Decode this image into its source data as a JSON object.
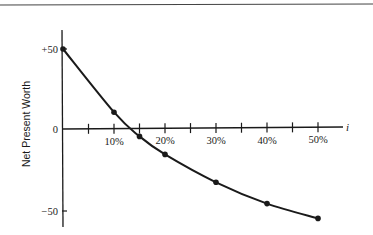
{
  "chart_data": {
    "type": "line",
    "title": "",
    "xlabel": "i",
    "ylabel": "Net Present Worth",
    "x": [
      0,
      10,
      15,
      20,
      30,
      40,
      50
    ],
    "series": [
      {
        "name": "Net Present Worth",
        "values": [
          50,
          10.5,
          -4.5,
          -15.5,
          -32.5,
          -45.5,
          -54.5
        ],
        "markers": true,
        "smooth": true
      }
    ],
    "x_ticks": [
      5,
      10,
      15,
      20,
      25,
      30,
      35,
      40,
      45,
      50
    ],
    "x_tick_labels": [
      {
        "value": 10,
        "label": "10%"
      },
      {
        "value": 20,
        "label": "20%"
      },
      {
        "value": 30,
        "label": "30%"
      },
      {
        "value": 40,
        "label": "40%"
      },
      {
        "value": 50,
        "label": "50%"
      }
    ],
    "y_ticks": [
      {
        "value": 50,
        "label": "+50"
      },
      {
        "value": 0,
        "label": "0"
      },
      {
        "value": -50,
        "label": "-50"
      }
    ],
    "xlim": [
      0,
      55
    ],
    "ylim": [
      -60,
      60
    ],
    "grid": false,
    "legend": "none",
    "top_rule": true
  },
  "colors": {
    "ink": "#1a1a1a",
    "background": "#ffffff",
    "rule": "#444444"
  }
}
